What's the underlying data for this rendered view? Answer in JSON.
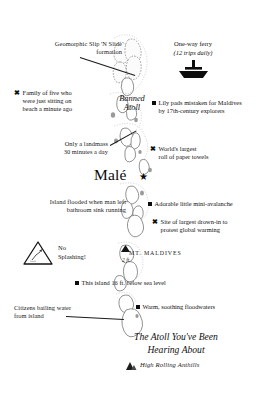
{
  "map": {
    "title_lines": [
      "The Atoll You've Been",
      "Hearing About"
    ],
    "footer_label": "High Rolling Anthills",
    "footer_icon": "mountain-icon",
    "capital": {
      "name": "Malé",
      "marker": "star-icon"
    },
    "atoll_label_lines": [
      "Banned",
      "Atoll"
    ],
    "peak": {
      "name": "MT. MALDIVES",
      "elevation": "2 ft.",
      "icon": "mountain-peak-icon"
    }
  },
  "ferry": {
    "title": "One-way ferry",
    "subtitle": "(12 trips daily)",
    "icon": "ferry-boat-icon"
  },
  "warning": {
    "icon": "warning-triangle-icon",
    "lines": [
      "No",
      "Splashing!"
    ]
  },
  "callouts": {
    "slip_n_slide": {
      "lines": [
        "Geomorphic Slip 'N Slide",
        "formation"
      ],
      "side": "left",
      "has_leader": true
    },
    "family_of_five": {
      "marker": "x-mark-icon",
      "lines": [
        "Family of five who",
        "were just sitting on",
        "beach a minute ago"
      ],
      "side": "left"
    },
    "lily_pads": {
      "marker": "square-bullet-icon",
      "lines": [
        "Lily pads mistaken for Maldives",
        "by 17th-century explorers"
      ],
      "side": "right"
    },
    "landmass_30_min": {
      "lines": [
        "Only a landmass",
        "30 minutes a day"
      ],
      "side": "left",
      "has_leader": true
    },
    "paper_towels": {
      "marker": "x-mark-icon",
      "lines": [
        "World's largest",
        "roll of paper towels"
      ],
      "side": "right"
    },
    "sink_running": {
      "lines": [
        "Island flooded when man left",
        "bathroom sink running"
      ],
      "side": "left"
    },
    "mini_avalanche": {
      "marker": "square-bullet-icon",
      "lines": [
        "Adorable little mini-avalanche"
      ],
      "side": "right"
    },
    "drown_in": {
      "marker": "x-mark-icon",
      "lines": [
        "Site of largest drown-in to",
        "protest global warming"
      ],
      "side": "right"
    },
    "below_sea_level": {
      "marker": "square-bullet-icon",
      "lines": [
        "This island 16 ft. below sea level"
      ],
      "side": "right"
    },
    "floodwaters": {
      "marker": "square-bullet-icon",
      "lines": [
        "Warm, soothing floodwaters"
      ],
      "side": "right"
    },
    "bailing_water": {
      "lines": [
        "Citizens bailing water",
        "from island"
      ],
      "side": "left",
      "has_leader": true
    }
  },
  "colors": {
    "ink": "#111111",
    "island_outline": "#6d6d6d",
    "reef": "#b5b5b5",
    "paper": "#ffffff"
  }
}
